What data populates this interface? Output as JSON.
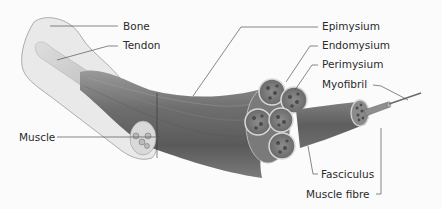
{
  "diagram": {
    "style": "grayscale anatomical illustration",
    "colors": {
      "background": "#fbfbfb",
      "bone": "#e8e8e8",
      "bone_outline": "#9a9a9a",
      "tendon": "#d2d2d2",
      "muscle_dark": "#5a5a5a",
      "muscle_mid": "#8a8a8a",
      "muscle_light": "#b5b5b5",
      "leader_line": "#555555",
      "text": "#2a2a2a"
    },
    "labels": [
      {
        "id": "bone",
        "text": "Bone"
      },
      {
        "id": "tendon",
        "text": "Tendon"
      },
      {
        "id": "epimysium",
        "text": "Epimysium"
      },
      {
        "id": "endomysium",
        "text": "Endomysium"
      },
      {
        "id": "perimysium",
        "text": "Perimysium"
      },
      {
        "id": "myofibril",
        "text": "Myofibril"
      },
      {
        "id": "muscle",
        "text": "Muscle"
      },
      {
        "id": "fasciculus",
        "text": "Fasciculus"
      },
      {
        "id": "muscle_fibre",
        "text": "Muscle fibre"
      }
    ]
  }
}
